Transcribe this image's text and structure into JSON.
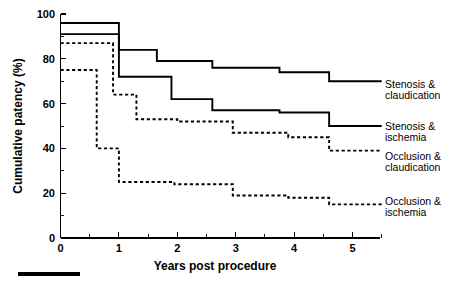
{
  "chart_data": {
    "type": "line",
    "subtype": "kaplan-meier-step",
    "title": "",
    "xlabel": "Years post procedure",
    "ylabel": "Cumulative patency (%)",
    "xlim": [
      0,
      5.55
    ],
    "ylim": [
      0,
      100
    ],
    "xticks": [
      0,
      1,
      2,
      3,
      4,
      5
    ],
    "xticklabels": [
      "0",
      "1",
      "2",
      "3",
      "4",
      "5"
    ],
    "xminor_ticks": [
      0.5,
      1.5,
      2.5,
      3.5,
      4.5,
      5.5
    ],
    "yticks": [
      0,
      20,
      40,
      60,
      80,
      100
    ],
    "yticklabels": [
      "0",
      "20",
      "40",
      "60",
      "80",
      "100"
    ],
    "yminor_ticks": [
      10,
      30,
      50,
      70,
      90
    ],
    "grid": false,
    "legend_position": "right-inline",
    "series": [
      {
        "name": "Stenosis & claudication",
        "linestyle": "solid",
        "color": "#000000",
        "x": [
          0,
          0.5,
          1.0,
          1.65,
          2.6,
          3.75,
          4.6,
          5.5
        ],
        "y": [
          96,
          96,
          84,
          79,
          76,
          74,
          70,
          70
        ]
      },
      {
        "name": "Stenosis & ischemia",
        "linestyle": "solid",
        "color": "#000000",
        "x": [
          0,
          0.5,
          1.0,
          1.9,
          2.6,
          3.75,
          4.6,
          5.5
        ],
        "y": [
          91,
          91,
          72,
          62,
          57,
          56,
          50,
          50
        ]
      },
      {
        "name": "Occlusion & claudication",
        "linestyle": "dashed",
        "color": "#000000",
        "x": [
          0,
          0.4,
          0.9,
          1.3,
          2.0,
          2.95,
          3.9,
          4.6,
          5.5
        ],
        "y": [
          87,
          87,
          64,
          53,
          52,
          47,
          45,
          39,
          39
        ]
      },
      {
        "name": "Occlusion & ischemia",
        "linestyle": "dashed",
        "color": "#000000",
        "x": [
          0,
          0.4,
          0.62,
          1.0,
          1.95,
          2.95,
          3.9,
          4.6,
          5.5
        ],
        "y": [
          75,
          75,
          40,
          25,
          24,
          19,
          18,
          15,
          15
        ]
      }
    ]
  },
  "axis": {
    "ylabel": "Cumulative patency (%)",
    "xlabel": "Years post procedure"
  },
  "legend": [
    {
      "line1": "Stenosis &",
      "line2": "claudication",
      "style": "solid"
    },
    {
      "line1": "Stenosis &",
      "line2": "ischemia",
      "style": "solid"
    },
    {
      "line1": "Occlusion &",
      "line2": "claudication",
      "style": "dashed"
    },
    {
      "line1": "Occlusion &",
      "line2": "ischemia",
      "style": "dashed"
    }
  ],
  "xticklabels": [
    "0",
    "1",
    "2",
    "3",
    "4",
    "5"
  ],
  "yticklabels": [
    "0",
    "20",
    "40",
    "60",
    "80",
    "100"
  ]
}
